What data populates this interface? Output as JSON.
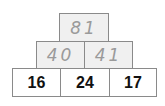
{
  "pyramid": {
    "description": "Number pyramid: each block is the sum of the two blocks below it",
    "rows": [
      {
        "level": "top",
        "cells": [
          {
            "value": "81",
            "style": "handwritten"
          }
        ]
      },
      {
        "level": "middle",
        "cells": [
          {
            "value": "40",
            "style": "handwritten"
          },
          {
            "value": "41",
            "style": "handwritten"
          }
        ]
      },
      {
        "level": "bottom",
        "cells": [
          {
            "value": "16",
            "style": "printed"
          },
          {
            "value": "24",
            "style": "printed"
          },
          {
            "value": "17",
            "style": "printed"
          }
        ]
      }
    ],
    "colors": {
      "border": "#8a8a8a",
      "handwritten_text": "#9a9a9a",
      "handwritten_fill": "#f0f0f0",
      "printed_text": "#111111"
    }
  }
}
